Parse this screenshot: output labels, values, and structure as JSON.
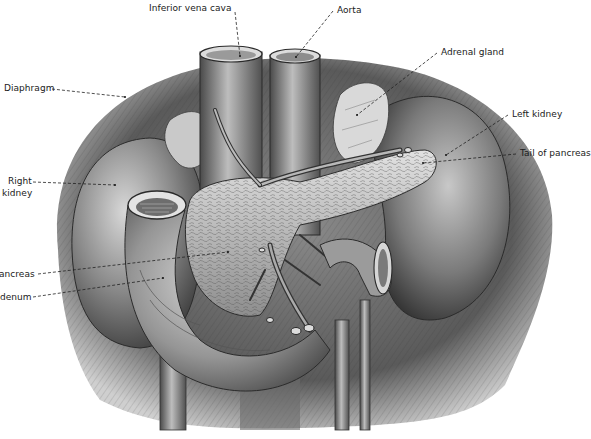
{
  "figure": {
    "style": "grayscale engraving",
    "colors": {
      "background": "#ffffff",
      "ink": "#1a1a1a",
      "leader_line": "#222222"
    }
  },
  "labels": [
    {
      "id": "ivc",
      "text": "Inferior vena cava",
      "x": 149,
      "y": 4,
      "target": [
        240,
        56
      ]
    },
    {
      "id": "aorta",
      "text": "Aorta",
      "x": 337,
      "y": 6,
      "target": [
        296,
        57
      ]
    },
    {
      "id": "diaphragm",
      "text": "Diaphragm",
      "x": 4,
      "y": 85,
      "target": [
        125,
        97
      ]
    },
    {
      "id": "adrenal",
      "text": "Adrenal gland",
      "x": 441,
      "y": 48,
      "target": [
        357,
        115
      ]
    },
    {
      "id": "left-kidney",
      "text": "Left kidney",
      "x": 512,
      "y": 110,
      "target": [
        446,
        155
      ]
    },
    {
      "id": "tail-pancreas",
      "text": "Tail of pancreas",
      "x": 520,
      "y": 149,
      "target": [
        423,
        163
      ]
    },
    {
      "id": "right-kidney-1",
      "text": "Right",
      "x": 8,
      "y": 177,
      "target": [
        115,
        185
      ]
    },
    {
      "id": "right-kidney-2",
      "text": "kidney",
      "x": 2,
      "y": 189
    },
    {
      "id": "head-pancreas",
      "text": "ancreas",
      "x": -1,
      "y": 271,
      "target": [
        228,
        252
      ]
    },
    {
      "id": "duodenum",
      "text": "denum",
      "x": 0,
      "y": 294,
      "target": [
        163,
        278
      ]
    }
  ]
}
